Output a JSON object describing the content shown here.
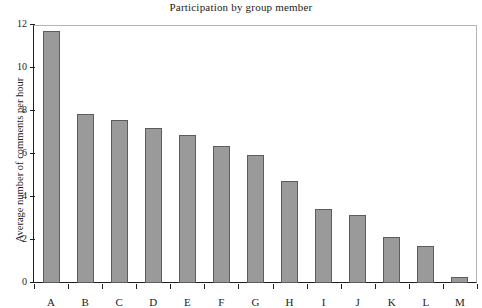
{
  "chart_data": {
    "type": "bar",
    "title": "Participation by group member",
    "xlabel": "",
    "ylabel": "Average number of comments per hour",
    "categories": [
      "A",
      "B",
      "C",
      "D",
      "E",
      "F",
      "G",
      "H",
      "I",
      "J",
      "K",
      "L",
      "M"
    ],
    "values": [
      11.7,
      7.85,
      7.6,
      7.2,
      6.9,
      6.35,
      5.95,
      4.75,
      3.45,
      3.15,
      2.15,
      1.7,
      0.3
    ],
    "ylim": [
      0,
      12
    ],
    "yticks": [
      0,
      2,
      4,
      6,
      8,
      10,
      12
    ],
    "ytick_labels": [
      "0",
      "2",
      "4",
      "6",
      "8",
      "10",
      "12"
    ],
    "grid": false,
    "legend": null,
    "bar_color": "#9a9a9a",
    "bar_edge_color": "#5c5c5c",
    "axis_color": "#1e1e1e",
    "frame_color": "#b4b4b4",
    "background": "#ffffff"
  }
}
